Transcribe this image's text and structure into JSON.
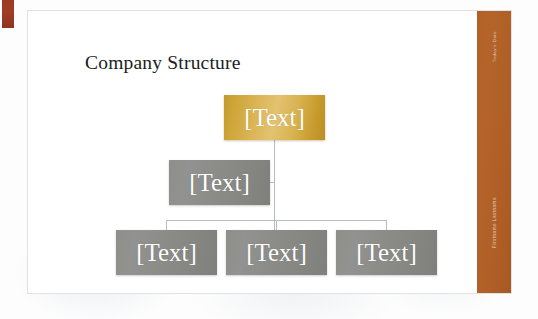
{
  "slide": {
    "title": "Company Structure",
    "sidebar": {
      "date_label": "Today's Date",
      "author_label": "Firstname Lastname"
    }
  },
  "colors": {
    "sidebar": "#b36227",
    "red_mark": "#9e3a24",
    "root_node": "#d8b250",
    "child_node": "#8b8b88",
    "connector": "#b9bcbf",
    "title_text": "#201d1c",
    "node_text": "#ffffff"
  },
  "chart_data": {
    "type": "diagram",
    "diagram_type": "organization-chart",
    "title": "Company Structure",
    "nodes": [
      {
        "id": "root",
        "label": "[Text]",
        "level": 0,
        "role": "top",
        "style": "gold"
      },
      {
        "id": "asst",
        "label": "[Text]",
        "level": 1,
        "role": "assistant",
        "style": "gray"
      },
      {
        "id": "c1",
        "label": "[Text]",
        "level": 2,
        "role": "child",
        "style": "gray"
      },
      {
        "id": "c2",
        "label": "[Text]",
        "level": 2,
        "role": "child",
        "style": "gray"
      },
      {
        "id": "c3",
        "label": "[Text]",
        "level": 2,
        "role": "child",
        "style": "gray"
      }
    ],
    "edges": [
      {
        "from": "root",
        "to": "asst"
      },
      {
        "from": "root",
        "to": "c1"
      },
      {
        "from": "root",
        "to": "c2"
      },
      {
        "from": "root",
        "to": "c3"
      }
    ]
  }
}
